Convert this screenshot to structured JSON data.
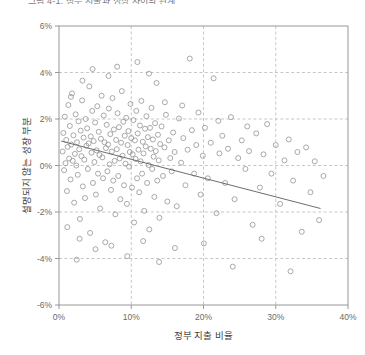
{
  "title": {
    "text": "그림 4-1. 정부 지출과 성장 사이의 관계",
    "clipped": true
  },
  "axis": {
    "x_title": "정부 지출 비율",
    "y_title": "설명되지 않는 성장 부분",
    "x_ticks": [
      "0%",
      "10%",
      "20%",
      "30%",
      "40%"
    ],
    "y_ticks": [
      "6%",
      "4%",
      "2%",
      "0%",
      "-2%",
      "-4%",
      "-6%"
    ]
  },
  "colors": {
    "marker_stroke": "#9a9a9a",
    "grid": "#b9b9b9",
    "frame": "#8d8d8d",
    "trend": "#5c5c5c",
    "tick_text": "#6b6b6b",
    "axis_title": "#3f3f3f"
  },
  "chart_data": {
    "type": "scatter",
    "title": "그림 4-1. 정부 지출과 성장 사이의 관계",
    "xlabel": "정부 지출 비율",
    "ylabel": "설명되지 않는 성장 부분",
    "xlim": [
      0,
      40
    ],
    "ylim": [
      -6,
      6
    ],
    "x_unit": "percent",
    "y_unit": "percent",
    "xticks": [
      0,
      10,
      20,
      30,
      40
    ],
    "yticks": [
      -6,
      -4,
      -2,
      0,
      2,
      4,
      6
    ],
    "grid": "dashed both axes",
    "legend": "none",
    "marker": {
      "shape": "circle",
      "filled": false,
      "size_px": 5
    },
    "trendline": {
      "type": "linear",
      "x_start": 0.3,
      "y_start": 1.05,
      "x_end": 36.2,
      "y_end": -1.85,
      "slope_per_pct": -0.0808,
      "intercept": 1.07
    },
    "points": [
      [
        0.5,
        0.6
      ],
      [
        0.6,
        1.4
      ],
      [
        0.7,
        -0.2
      ],
      [
        0.8,
        2.1
      ],
      [
        0.9,
        0.1
      ],
      [
        1.0,
        1.1
      ],
      [
        1.1,
        -1.1
      ],
      [
        1.2,
        0.8
      ],
      [
        1.3,
        2.6
      ],
      [
        1.4,
        0.3
      ],
      [
        1.5,
        1.7
      ],
      [
        1.6,
        -0.6
      ],
      [
        1.7,
        0.9
      ],
      [
        1.8,
        3.1
      ],
      [
        1.9,
        0.2
      ],
      [
        2.0,
        1.3
      ],
      [
        2.1,
        -1.6
      ],
      [
        2.2,
        0.5
      ],
      [
        2.3,
        2.2
      ],
      [
        2.4,
        0.0
      ],
      [
        2.5,
        1.0
      ],
      [
        2.6,
        -0.4
      ],
      [
        2.7,
        1.9
      ],
      [
        2.8,
        0.7
      ],
      [
        2.9,
        -2.3
      ],
      [
        3.0,
        1.5
      ],
      [
        3.1,
        0.4
      ],
      [
        3.2,
        2.8
      ],
      [
        3.3,
        -0.9
      ],
      [
        3.4,
        1.2
      ],
      [
        3.5,
        0.25
      ],
      [
        3.6,
        -1.4
      ],
      [
        3.7,
        2.0
      ],
      [
        3.8,
        0.85
      ],
      [
        3.9,
        1.6
      ],
      [
        4.0,
        -0.15
      ],
      [
        4.1,
        0.95
      ],
      [
        4.2,
        3.4
      ],
      [
        4.3,
        -2.9
      ],
      [
        4.4,
        1.25
      ],
      [
        4.5,
        0.55
      ],
      [
        4.6,
        2.35
      ],
      [
        4.7,
        -0.75
      ],
      [
        4.8,
        1.05
      ],
      [
        4.9,
        0.15
      ],
      [
        5.0,
        1.85
      ],
      [
        5.1,
        -1.25
      ],
      [
        5.2,
        0.65
      ],
      [
        5.3,
        2.55
      ],
      [
        5.4,
        -0.35
      ],
      [
        5.5,
        1.45
      ],
      [
        5.6,
        0.45
      ],
      [
        5.7,
        -1.85
      ],
      [
        5.8,
        1.15
      ],
      [
        5.9,
        3.0
      ],
      [
        6.0,
        0.35
      ],
      [
        6.1,
        -0.55
      ],
      [
        6.2,
        2.15
      ],
      [
        6.3,
        1.0
      ],
      [
        6.4,
        -3.3
      ],
      [
        6.5,
        0.75
      ],
      [
        6.6,
        1.75
      ],
      [
        6.7,
        -0.25
      ],
      [
        6.8,
        0.9
      ],
      [
        6.9,
        2.45
      ],
      [
        7.0,
        0.05
      ],
      [
        7.1,
        1.35
      ],
      [
        7.2,
        -1.05
      ],
      [
        7.3,
        0.6
      ],
      [
        7.4,
        2.9
      ],
      [
        7.5,
        -0.65
      ],
      [
        7.6,
        1.55
      ],
      [
        7.7,
        0.2
      ],
      [
        7.8,
        -2.1
      ],
      [
        7.9,
        1.1
      ],
      [
        8.0,
        0.7
      ],
      [
        8.1,
        2.25
      ],
      [
        8.2,
        -0.45
      ],
      [
        8.3,
        1.65
      ],
      [
        8.4,
        0.3
      ],
      [
        8.5,
        -1.45
      ],
      [
        8.6,
        0.98
      ],
      [
        8.7,
        3.2
      ],
      [
        8.8,
        0.42
      ],
      [
        8.9,
        1.88
      ],
      [
        9.0,
        -0.85
      ],
      [
        9.1,
        1.28
      ],
      [
        9.2,
        0.08
      ],
      [
        9.3,
        2.05
      ],
      [
        9.4,
        -1.65
      ],
      [
        9.5,
        0.88
      ],
      [
        9.6,
        1.48
      ],
      [
        9.7,
        -0.05
      ],
      [
        9.8,
        0.58
      ],
      [
        9.9,
        2.65
      ],
      [
        10.0,
        1.18
      ],
      [
        10.1,
        -0.95
      ],
      [
        10.2,
        0.48
      ],
      [
        10.3,
        1.95
      ],
      [
        10.4,
        -2.45
      ],
      [
        10.5,
        1.08
      ],
      [
        10.6,
        0.28
      ],
      [
        10.7,
        2.35
      ],
      [
        10.8,
        -0.55
      ],
      [
        10.9,
        1.38
      ],
      [
        11.0,
        0.68
      ],
      [
        11.1,
        -1.15
      ],
      [
        11.2,
        1.72
      ],
      [
        11.3,
        0.18
      ],
      [
        11.4,
        2.78
      ],
      [
        11.5,
        -0.35
      ],
      [
        11.6,
        1.02
      ],
      [
        11.7,
        0.52
      ],
      [
        11.8,
        -1.95
      ],
      [
        11.9,
        1.58
      ],
      [
        12.0,
        0.82
      ],
      [
        12.1,
        2.12
      ],
      [
        12.2,
        -0.75
      ],
      [
        12.3,
        1.22
      ],
      [
        12.4,
        0.02
      ],
      [
        12.5,
        -2.75
      ],
      [
        12.6,
        1.62
      ],
      [
        12.7,
        0.72
      ],
      [
        12.8,
        2.48
      ],
      [
        12.9,
        -0.15
      ],
      [
        13.0,
        1.12
      ],
      [
        13.1,
        0.38
      ],
      [
        13.2,
        -1.35
      ],
      [
        13.3,
        1.82
      ],
      [
        13.4,
        0.62
      ],
      [
        13.5,
        3.55
      ],
      [
        13.6,
        -0.65
      ],
      [
        13.7,
        1.32
      ],
      [
        13.8,
        0.22
      ],
      [
        13.9,
        -2.25
      ],
      [
        14.0,
        0.92
      ],
      [
        14.2,
        1.68
      ],
      [
        14.4,
        -0.45
      ],
      [
        14.6,
        0.78
      ],
      [
        14.8,
        2.18
      ],
      [
        15.0,
        -1.55
      ],
      [
        15.2,
        1.08
      ],
      [
        15.4,
        0.32
      ],
      [
        15.6,
        -0.25
      ],
      [
        15.8,
        1.42
      ],
      [
        16.0,
        0.58
      ],
      [
        16.3,
        -1.75
      ],
      [
        16.6,
        2.02
      ],
      [
        16.9,
        0.12
      ],
      [
        17.2,
        1.18
      ],
      [
        17.5,
        -0.85
      ],
      [
        17.8,
        0.68
      ],
      [
        18.1,
        4.6
      ],
      [
        18.4,
        1.52
      ],
      [
        18.7,
        -0.35
      ],
      [
        19.0,
        0.88
      ],
      [
        19.3,
        2.28
      ],
      [
        19.6,
        -1.25
      ],
      [
        19.9,
        0.42
      ],
      [
        20.2,
        1.62
      ],
      [
        20.6,
        -0.55
      ],
      [
        21.0,
        0.98
      ],
      [
        21.4,
        3.75
      ],
      [
        21.8,
        -2.05
      ],
      [
        22.2,
        0.52
      ],
      [
        22.6,
        1.28
      ],
      [
        23.0,
        -0.75
      ],
      [
        23.4,
        0.72
      ],
      [
        23.8,
        2.08
      ],
      [
        24.3,
        -1.45
      ],
      [
        24.8,
        0.32
      ],
      [
        25.3,
        1.08
      ],
      [
        25.8,
        -0.15
      ],
      [
        26.3,
        0.62
      ],
      [
        26.8,
        -2.55
      ],
      [
        27.3,
        1.38
      ],
      [
        27.8,
        -0.95
      ],
      [
        28.3,
        0.48
      ],
      [
        28.8,
        1.78
      ],
      [
        29.4,
        -0.35
      ],
      [
        30.0,
        0.88
      ],
      [
        30.6,
        -1.65
      ],
      [
        31.2,
        0.22
      ],
      [
        31.8,
        1.12
      ],
      [
        32.4,
        -0.65
      ],
      [
        33.0,
        0.58
      ],
      [
        33.6,
        -2.85
      ],
      [
        34.2,
        0.78
      ],
      [
        34.8,
        -1.15
      ],
      [
        35.4,
        0.18
      ],
      [
        36.0,
        -2.35
      ],
      [
        36.6,
        -0.45
      ],
      [
        5.05,
        -3.6
      ],
      [
        7.25,
        -3.45
      ],
      [
        9.45,
        -3.9
      ],
      [
        11.65,
        -3.25
      ],
      [
        13.85,
        -4.15
      ],
      [
        16.05,
        -3.55
      ],
      [
        20.05,
        -3.35
      ],
      [
        24.05,
        -4.35
      ],
      [
        28.05,
        -3.15
      ],
      [
        32.05,
        -4.55
      ],
      [
        2.45,
        -4.05
      ],
      [
        4.65,
        4.15
      ],
      [
        6.85,
        3.85
      ],
      [
        8.05,
        4.25
      ],
      [
        12.45,
        3.95
      ],
      [
        10.85,
        4.45
      ],
      [
        3.25,
        3.65
      ],
      [
        1.65,
        2.95
      ],
      [
        14.65,
        2.72
      ],
      [
        17.05,
        2.58
      ],
      [
        22.05,
        1.92
      ],
      [
        26.05,
        1.68
      ],
      [
        1.15,
        -2.65
      ],
      [
        2.85,
        -3.15
      ]
    ]
  }
}
